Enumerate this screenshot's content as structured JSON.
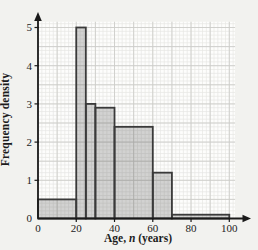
{
  "chart_data": {
    "type": "bar",
    "subtype": "histogram",
    "title": "",
    "xlabel": "Age, n (years)",
    "xlabel_parts": {
      "prefix": "Age, ",
      "var": "n",
      "suffix": " (years)"
    },
    "ylabel": "Frequency density",
    "x_ticks": [
      0,
      20,
      40,
      60,
      80,
      100
    ],
    "y_ticks": [
      0,
      1,
      2,
      3,
      4,
      5
    ],
    "xlim": [
      0,
      110
    ],
    "ylim": [
      0,
      5.25
    ],
    "grid": {
      "visible": true,
      "minor_step_x_years": 2,
      "minor_step_y_units": 0.1,
      "major_step_x_years": 10,
      "major_step_y_units": 0.5
    },
    "bins": [
      {
        "x0": 0,
        "x1": 20,
        "frequency_density": 0.5
      },
      {
        "x0": 20,
        "x1": 25,
        "frequency_density": 5.0
      },
      {
        "x0": 25,
        "x1": 30,
        "frequency_density": 3.0
      },
      {
        "x0": 30,
        "x1": 40,
        "frequency_density": 2.9
      },
      {
        "x0": 40,
        "x1": 60,
        "frequency_density": 2.4
      },
      {
        "x0": 60,
        "x1": 70,
        "frequency_density": 1.2
      },
      {
        "x0": 70,
        "x1": 100,
        "frequency_density": 0.1
      }
    ],
    "colors": {
      "background": "#f2f2ef",
      "plot_background": "#fdfdfc",
      "grid_minor": "#e7e7e4",
      "grid_major": "#cdcdca",
      "bar_fill": "rgba(60,60,60,0.22)",
      "bar_stroke": "#3a3a3a",
      "axis": "#1a1a1a",
      "tick_label": "#222222"
    }
  }
}
